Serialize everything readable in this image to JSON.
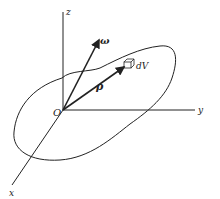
{
  "diagram": {
    "type": "3d-rigid-body-coordinates",
    "colors": {
      "ink": "#222222",
      "background": "#ffffff"
    },
    "labels": {
      "z_axis": "z",
      "y_axis": "y",
      "x_axis": "x",
      "origin": "O",
      "omega": "ω",
      "rho": "ρ",
      "volume_element": "dV"
    }
  }
}
